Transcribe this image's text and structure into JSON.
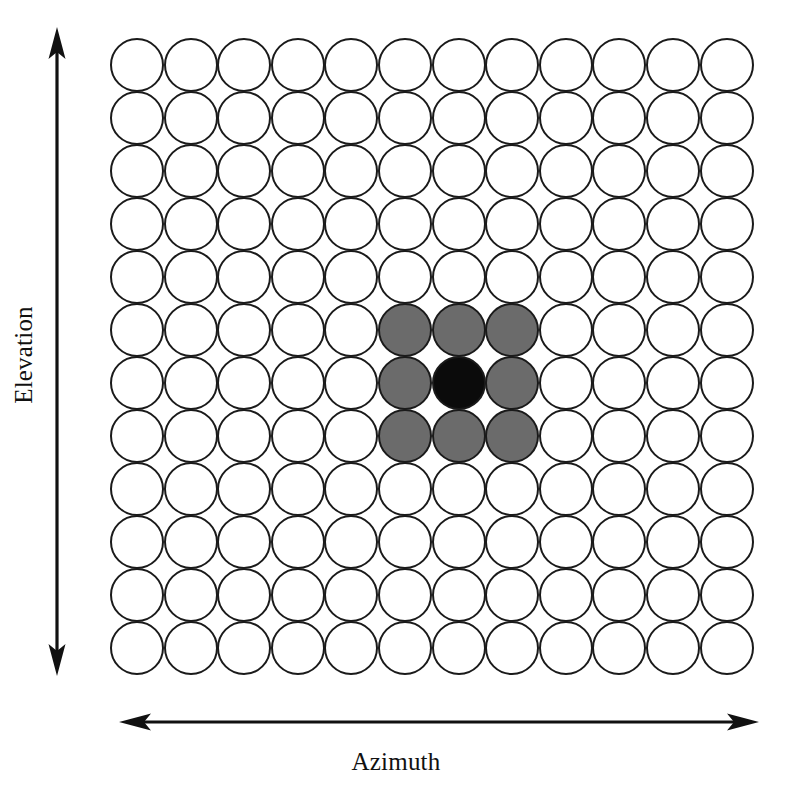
{
  "figure": {
    "title": "",
    "background_color": "#ffffff"
  },
  "axes": {
    "vertical": {
      "label": "Elevation",
      "arrow_style": "double-headed",
      "orientation": "vertical",
      "color": "#111111"
    },
    "horizontal": {
      "label": "Azimuth",
      "arrow_style": "double-headed",
      "orientation": "horizontal",
      "color": "#111111"
    }
  },
  "legend_colors": {
    "empty": "#ffffff",
    "neighbor": "#6b6b6b",
    "center": "#0b0b0b",
    "outline": "#1a1a1a"
  },
  "chart_data": {
    "type": "heatmap",
    "title": "",
    "xlabel": "Azimuth",
    "ylabel": "Elevation",
    "rows": 12,
    "cols": 12,
    "grid_geometry": {
      "left": 110,
      "top": 38,
      "cell_pitch_x": 53.6,
      "cell_pitch_y": 53.0,
      "circle_diameter": 54
    },
    "state_legend": {
      "0": "empty",
      "1": "neighbor",
      "2": "center"
    },
    "values": [
      [
        0,
        0,
        0,
        0,
        0,
        0,
        0,
        0,
        0,
        0,
        0,
        0
      ],
      [
        0,
        0,
        0,
        0,
        0,
        0,
        0,
        0,
        0,
        0,
        0,
        0
      ],
      [
        0,
        0,
        0,
        0,
        0,
        0,
        0,
        0,
        0,
        0,
        0,
        0
      ],
      [
        0,
        0,
        0,
        0,
        0,
        0,
        0,
        0,
        0,
        0,
        0,
        0
      ],
      [
        0,
        0,
        0,
        0,
        0,
        0,
        0,
        0,
        0,
        0,
        0,
        0
      ],
      [
        0,
        0,
        0,
        0,
        0,
        1,
        1,
        1,
        0,
        0,
        0,
        0
      ],
      [
        0,
        0,
        0,
        0,
        0,
        1,
        2,
        1,
        0,
        0,
        0,
        0
      ],
      [
        0,
        0,
        0,
        0,
        0,
        1,
        1,
        1,
        0,
        0,
        0,
        0
      ],
      [
        0,
        0,
        0,
        0,
        0,
        0,
        0,
        0,
        0,
        0,
        0,
        0
      ],
      [
        0,
        0,
        0,
        0,
        0,
        0,
        0,
        0,
        0,
        0,
        0,
        0
      ],
      [
        0,
        0,
        0,
        0,
        0,
        0,
        0,
        0,
        0,
        0,
        0,
        0
      ],
      [
        0,
        0,
        0,
        0,
        0,
        0,
        0,
        0,
        0,
        0,
        0,
        0
      ]
    ],
    "highlight_block": {
      "row_start": 6,
      "row_end": 8,
      "col_start": 6,
      "col_end": 8,
      "center_row": 7,
      "center_col": 7,
      "neighbor_count": 8
    },
    "grid": true,
    "legend_position": "none"
  }
}
